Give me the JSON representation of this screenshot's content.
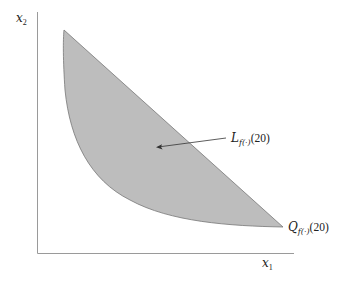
{
  "diagram": {
    "axes": {
      "x_label_base": "x",
      "x_label_sub": "1",
      "y_label_base": "x",
      "y_label_sub": "2"
    },
    "region": {
      "fill_color": "#bdbdbd",
      "edge_color": "#777777"
    },
    "labels": {
      "level_set_base": "L",
      "level_set_sub": "f(·)",
      "level_set_arg": "(20)",
      "isoquant_base": "Q",
      "isoquant_sub": "f(·)",
      "isoquant_arg": "(20)"
    }
  }
}
